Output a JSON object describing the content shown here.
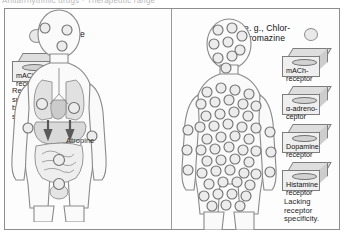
{
  "figure": {
    "top_cutoff_text": "Antiarrhythmic drugs · Therapeutic range",
    "panels": [
      {
        "id": "left",
        "drug_label": "Atropine",
        "legend_circle_icon": "receptor-circle-icon",
        "receptor_boxes": [
          {
            "label": "mACh-\nreceptor",
            "icon": "receptor-box-icon"
          }
        ],
        "caption": "Receptor\nspecificity\nbut lacking organ\nselectivity",
        "body_annotation": "Atropine",
        "body_description": "anatomical-figure-with-organs",
        "receptor_dot_count": 9
      },
      {
        "id": "right",
        "drug_label": "e. g., Chlor-\npromazine",
        "legend_circle_icon": "receptor-circle-icon",
        "receptor_boxes": [
          {
            "label": "mACh-\nreceptor",
            "icon": "receptor-box-icon"
          },
          {
            "label": "α-adreno-\nceptor",
            "icon": "receptor-box-icon"
          },
          {
            "label": "Dopamine\nreceptor",
            "icon": "receptor-box-icon"
          },
          {
            "label": "Histamine\nreceptor",
            "icon": "receptor-box-icon"
          }
        ],
        "caption": "Lacking\nreceptor\nspecificity.",
        "body_description": "plain-figure-covered-in-receptors",
        "receptor_dot_count": 62
      }
    ],
    "colors": {
      "frame_border": "#8d8d8d",
      "divider": "#9a9a9a",
      "circle_fill": "#ececec",
      "circle_stroke": "#6f6f6f",
      "box_front": "#efefef",
      "box_top": "#dedede",
      "box_side": "#cdcdcd",
      "background": "#fdfdfd",
      "text": "#1d1d1d"
    }
  }
}
